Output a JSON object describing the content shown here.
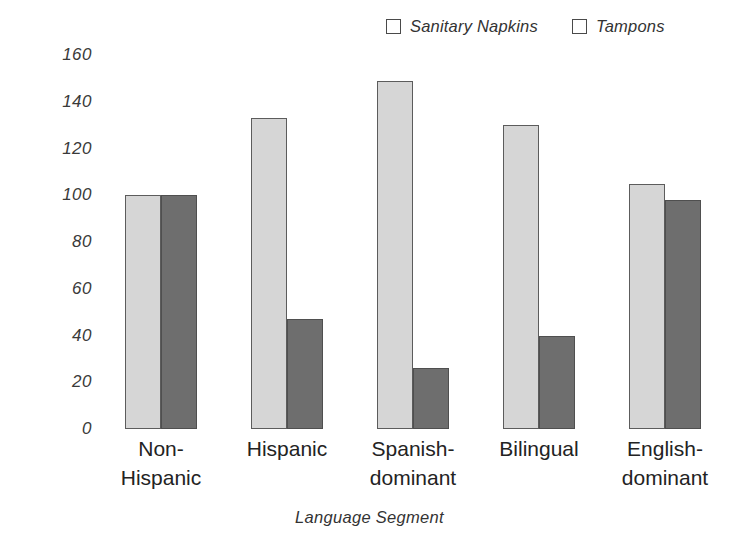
{
  "chart_data": {
    "type": "bar",
    "title": "",
    "subtitle": "",
    "xlabel": "Language Segment",
    "ylabel": "",
    "categories": [
      "Non-\nHispanic",
      "Hispanic",
      "Spanish-\ndominant",
      "Bilingual",
      "English-\ndominant"
    ],
    "series": [
      {
        "name": "Sanitary Napkins",
        "color": "#d6d6d6",
        "values": [
          100,
          133,
          149,
          130,
          105
        ]
      },
      {
        "name": "Tampons",
        "color": "#6e6e6e",
        "values": [
          100,
          47,
          26,
          40,
          98
        ]
      }
    ],
    "ylim": [
      0,
      160
    ],
    "yticks": [
      "0",
      "20",
      "40",
      "60",
      "80",
      "100",
      "120",
      "140",
      "160"
    ],
    "ytick_values": [
      0,
      20,
      40,
      60,
      80,
      100,
      120,
      140,
      160
    ],
    "grid": false,
    "legend_position": "top-right"
  },
  "legend": {
    "entries": [
      {
        "label": "Sanitary Napkins",
        "swatch_color": "#d6d6d6"
      },
      {
        "label": "Tampons",
        "swatch_color": "#6e6e6e"
      }
    ]
  },
  "axis": {
    "x_title": "Language Segment"
  }
}
